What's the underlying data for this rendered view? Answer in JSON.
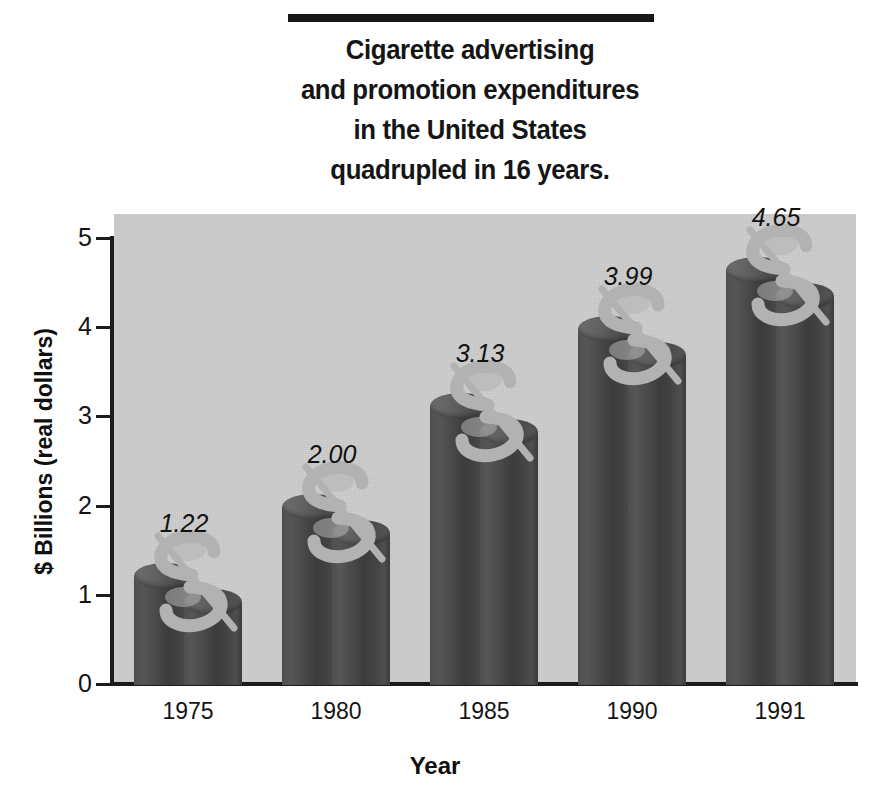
{
  "chart_data": {
    "type": "bar",
    "title": "Cigarette advertising and promotion expenditures in the United States quadrupled in 16 years.",
    "title_lines": [
      "Cigarette advertising",
      "and promotion expenditures",
      "in the United States",
      "quadrupled in 16 years."
    ],
    "categories": [
      "1975",
      "1980",
      "1985",
      "1990",
      "1991"
    ],
    "values": [
      1.22,
      2.0,
      3.13,
      3.99,
      4.65
    ],
    "value_labels": [
      "1.22",
      "2.00",
      "3.13",
      "3.99",
      "4.65"
    ],
    "xlabel": "Year",
    "ylabel": "$ Billions (real dollars)",
    "ylim": [
      0,
      5
    ],
    "ytick_labels": [
      "0",
      "1",
      "2",
      "3",
      "4",
      "5"
    ],
    "ytick_values": [
      0,
      1,
      2,
      3,
      4,
      5
    ],
    "grid": false,
    "legend": null,
    "units": "$ Billions (real dollars)",
    "style": "3-D dollar-sign cylinder bars, grayscale print scan"
  },
  "colors": {
    "page_background": "#ffffff",
    "plot_background": "#cdcdcd",
    "bar_dark": "#3c3c3c",
    "bar_mid": "#4f4f4f",
    "bar_highlight": "#6e6e6e",
    "dollar_glyph": "#b2b2b2",
    "axis": "#1b1b1b",
    "text": "#121212",
    "title_rule": "#181818"
  },
  "icons": {
    "bar_overlay": "dollar-sign-icon"
  }
}
